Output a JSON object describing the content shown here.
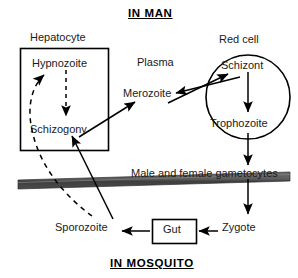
{
  "diagram": {
    "title_top": "IN MAN",
    "title_bottom": "IN MOSQUITO",
    "labels": {
      "hepatocyte": "Hepatocyte",
      "hypnozoite": "Hypnozoite",
      "schizogony": "Schizogony",
      "plasma": "Plasma",
      "merozoite": "Merozoite",
      "red_cell": "Red cell",
      "schizont": "Schizont",
      "trophozoite": "Trophozoite",
      "gametocytes": "Male and female gametocytes",
      "sporozoite": "Sporozoite",
      "gut": "Gut",
      "zygote": "Zygote"
    },
    "colors": {
      "background": "#ffffff",
      "ink": "#000000",
      "text": "#1a1a1a",
      "barrier_bar": "#5a5a5a",
      "barrier_bar_shade": "#3d3d3d"
    },
    "shapes": [
      {
        "name": "hepatocyte-box",
        "type": "rectangle",
        "x": 20,
        "y": 48,
        "width": 88,
        "height": 102
      },
      {
        "name": "red-cell-circle",
        "type": "circle",
        "cx": 248,
        "cy": 97,
        "r": 42
      },
      {
        "name": "gut-box",
        "type": "rectangle",
        "x": 152,
        "y": 219,
        "width": 44,
        "height": 24
      },
      {
        "name": "skin-barrier",
        "type": "band",
        "y_left": 182,
        "y_right": 174
      }
    ],
    "arrows": [
      {
        "name": "hypnozoite-to-schizogony",
        "style": "dashed",
        "from": "Hypnozoite",
        "to": "Schizogony"
      },
      {
        "name": "sporozoite-to-hypnozoite",
        "style": "dashed-curve",
        "from": "Sporozoite",
        "to": "Hypnozoite"
      },
      {
        "name": "sporozoite-to-schizogony",
        "style": "solid",
        "from": "Sporozoite",
        "to": "Schizogony"
      },
      {
        "name": "schizogony-to-merozoite",
        "style": "solid",
        "from": "Schizogony",
        "to": "Merozoite"
      },
      {
        "name": "merozoite-to-schizont",
        "style": "solid",
        "from": "Merozoite",
        "to": "Schizont"
      },
      {
        "name": "schizont-to-merozoite",
        "style": "solid",
        "from": "Schizont",
        "to": "Merozoite"
      },
      {
        "name": "schizont-to-trophozoite",
        "style": "solid",
        "from": "Schizont",
        "to": "Trophozoite"
      },
      {
        "name": "trophozoite-to-gametocytes",
        "style": "solid",
        "from": "Trophozoite",
        "to": "Male and female gametocytes"
      },
      {
        "name": "gametocytes-to-zygote",
        "style": "solid",
        "from": "Male and female gametocytes",
        "to": "Zygote"
      },
      {
        "name": "zygote-to-gut",
        "style": "solid",
        "from": "Zygote",
        "to": "Gut"
      },
      {
        "name": "gut-to-sporozoite",
        "style": "solid",
        "from": "Gut",
        "to": "Sporozoite"
      }
    ]
  }
}
